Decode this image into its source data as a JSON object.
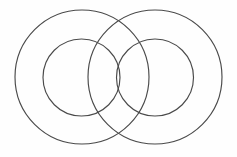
{
  "figure": {
    "background_color": "#fefefe",
    "stroke_color": "#4a4a4a",
    "stroke_width": 1.15,
    "canvas": {
      "width": 237,
      "height": 157
    },
    "caption": ""
  },
  "chart_data": {
    "type": "scatter",
    "xlabel": "",
    "ylabel": "",
    "xlim": [
      0,
      237
    ],
    "ylim": [
      0,
      157
    ],
    "grid": false,
    "legend": "none",
    "shapes": [
      {
        "name": "left-outer-circle",
        "shape": "circle",
        "cx": 82,
        "cy": 77,
        "r": 67,
        "stroke": "#4a4a4a",
        "fill": "none"
      },
      {
        "name": "left-inner-circle",
        "shape": "circle",
        "cx": 81.5,
        "cy": 77.5,
        "r": 38.5,
        "stroke": "#4a4a4a",
        "fill": "none"
      },
      {
        "name": "right-outer-circle",
        "shape": "circle",
        "cx": 155,
        "cy": 77,
        "r": 67,
        "stroke": "#4a4a4a",
        "fill": "none"
      },
      {
        "name": "right-inner-circle",
        "shape": "circle",
        "cx": 155,
        "cy": 77.5,
        "r": 38.5,
        "stroke": "#4a4a4a",
        "fill": "none"
      }
    ],
    "annotations": []
  }
}
